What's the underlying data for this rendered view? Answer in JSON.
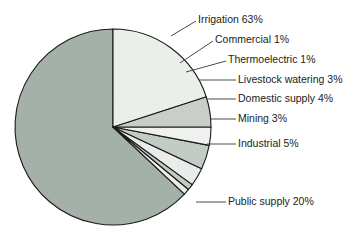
{
  "chart_data": {
    "type": "pie",
    "title": "",
    "subtitle": "",
    "xlabel": "",
    "ylabel": "",
    "legend_position": "callout-labels-right",
    "grid": false,
    "units": "percent",
    "start_angle_deg": 0,
    "direction": "counterclockwise",
    "categories": [
      "Irrigation",
      "Commercial",
      "Thermoelectric",
      "Livestock watering",
      "Domestic supply",
      "Mining",
      "Industrial",
      "Public supply"
    ],
    "values": [
      63,
      1,
      1,
      3,
      4,
      3,
      5,
      20
    ],
    "labels": [
      "Irrigation 63%",
      "Commercial 1%",
      "Thermoelectric 1%",
      "Livestock watering 3%",
      "Domestic supply 4%",
      "Mining 3%",
      "Industrial 5%",
      "Public supply 20%"
    ],
    "slice_colors": [
      "#a4b1a9",
      "#e9ece9",
      "#c3ccc4",
      "#e9ece9",
      "#c3ccc4",
      "#eef1ee",
      "#c7cfc8",
      "#eaefea"
    ],
    "slice_outline_color": "#1a1a1a",
    "background_color": "#ffffff",
    "text_color": "#1c1c1c",
    "leader_line_color": "#4b4b4b"
  },
  "chart": {
    "center_x": 113,
    "center_y": 127,
    "radius": 98
  },
  "callouts": [
    {
      "label": "Irrigation 63%",
      "text_x": 198,
      "text_y": 20,
      "line": "M 171,36 L 196,21",
      "name": "callout-irrigation"
    },
    {
      "label": "Commercial 1%",
      "text_x": 215,
      "text_y": 40,
      "line": "M 180,63 L 213,41",
      "name": "callout-commercial"
    },
    {
      "label": "Thermoelectric 1%",
      "text_x": 228,
      "text_y": 60,
      "line": "M 186,72 L 226,61",
      "name": "callout-thermoelectric"
    },
    {
      "label": "Livestock watering 3%",
      "text_x": 238,
      "text_y": 80,
      "line": "M 199,80 L 236,80",
      "name": "callout-livestock-watering"
    },
    {
      "label": "Domestic supply 4%",
      "text_x": 238,
      "text_y": 99,
      "line": "M 207,99 L 236,99",
      "name": "callout-domestic-supply"
    },
    {
      "label": "Mining 3%",
      "text_x": 238,
      "text_y": 119,
      "line": "M 211,119 L 236,119",
      "name": "callout-mining"
    },
    {
      "label": "Industrial 5%",
      "text_x": 238,
      "text_y": 144,
      "line": "M 207,144 L 236,144",
      "name": "callout-industrial"
    },
    {
      "label": "Public supply 20%",
      "text_x": 228,
      "text_y": 202,
      "line": "M 196,202 L 226,202",
      "name": "callout-public-supply"
    }
  ]
}
